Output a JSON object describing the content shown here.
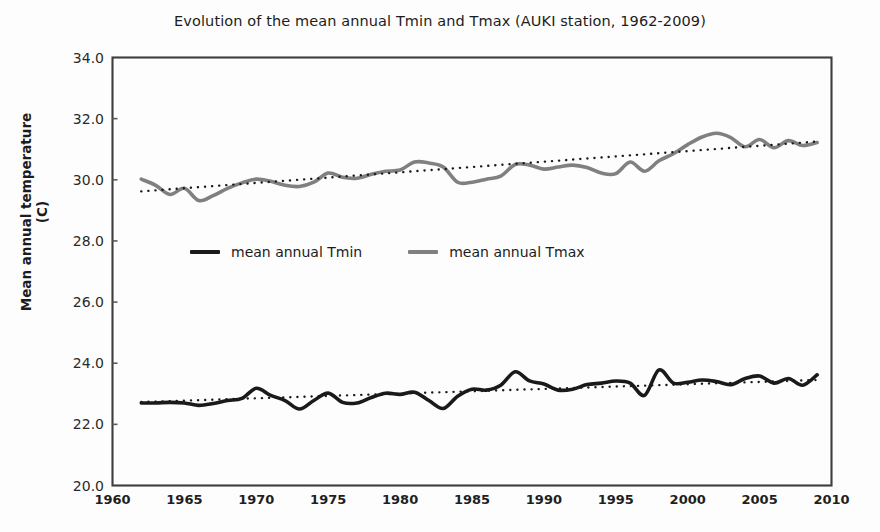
{
  "chart_data": {
    "type": "line",
    "title": "Evolution of the mean annual Tmin and Tmax (AUKI station, 1962-2009)",
    "xlabel": "",
    "ylabel": "Mean annual temperature (C)",
    "xlim": [
      1960,
      2010
    ],
    "ylim": [
      20.0,
      34.0
    ],
    "ytick_labels": [
      "34.0",
      "32.0",
      "30.0",
      "28.0",
      "26.0",
      "24.0",
      "22.0",
      "20.0"
    ],
    "ytick_values": [
      34.0,
      32.0,
      30.0,
      28.0,
      26.0,
      24.0,
      22.0,
      20.0
    ],
    "xtick_labels": [
      "1960",
      "1965",
      "1970",
      "1975",
      "1980",
      "1985",
      "1990",
      "1995",
      "2000",
      "2005",
      "2010"
    ],
    "xtick_values": [
      1960,
      1965,
      1970,
      1975,
      1980,
      1985,
      1990,
      1995,
      2000,
      2005,
      2010
    ],
    "grid": false,
    "legend_position": "inside-center-upper",
    "colors": {
      "tmin": "#1a1a1a",
      "tmax": "#808080",
      "trend": "#1a1a1a",
      "frame": "#3d3d3d",
      "background": "#fdfdfd"
    },
    "x": [
      1962,
      1963,
      1964,
      1965,
      1966,
      1967,
      1968,
      1969,
      1970,
      1971,
      1972,
      1973,
      1974,
      1975,
      1976,
      1977,
      1978,
      1979,
      1980,
      1981,
      1982,
      1983,
      1984,
      1985,
      1986,
      1987,
      1988,
      1989,
      1990,
      1991,
      1992,
      1993,
      1994,
      1995,
      1996,
      1997,
      1998,
      1999,
      2000,
      2001,
      2002,
      2003,
      2004,
      2005,
      2006,
      2007,
      2008,
      2009
    ],
    "series": [
      {
        "name": "mean annual Tmin",
        "color": "#1a1a1a",
        "values": [
          22.7,
          22.7,
          22.72,
          22.7,
          22.62,
          22.68,
          22.78,
          22.85,
          23.18,
          22.95,
          22.78,
          22.5,
          22.78,
          23.02,
          22.72,
          22.7,
          22.88,
          23.02,
          22.98,
          23.05,
          22.78,
          22.52,
          22.92,
          23.15,
          23.12,
          23.28,
          23.72,
          23.42,
          23.32,
          23.12,
          23.15,
          23.3,
          23.35,
          23.42,
          23.35,
          22.95,
          23.78,
          23.35,
          23.38,
          23.45,
          23.4,
          23.3,
          23.5,
          23.58,
          23.35,
          23.5,
          23.28,
          23.62
        ]
      },
      {
        "name": "mean annual Tmax",
        "color": "#808080",
        "values": [
          30.02,
          29.82,
          29.52,
          29.72,
          29.32,
          29.48,
          29.72,
          29.9,
          30.02,
          29.95,
          29.82,
          29.78,
          29.92,
          30.22,
          30.08,
          30.05,
          30.18,
          30.28,
          30.32,
          30.58,
          30.55,
          30.42,
          29.92,
          29.92,
          30.02,
          30.12,
          30.5,
          30.48,
          30.35,
          30.42,
          30.48,
          30.4,
          30.22,
          30.2,
          30.58,
          30.28,
          30.62,
          30.85,
          31.15,
          31.4,
          31.52,
          31.38,
          31.08,
          31.32,
          31.05,
          31.28,
          31.12,
          31.22
        ]
      }
    ],
    "trendlines": [
      {
        "name": "Tmin linear trend",
        "style": "dotted",
        "color": "#1a1a1a",
        "x_start": 1962,
        "x_end": 2009,
        "y_start": 22.73,
        "y_end": 23.45
      },
      {
        "name": "Tmax linear trend",
        "style": "dotted",
        "color": "#1a1a1a",
        "x_start": 1962,
        "x_end": 2009,
        "y_start": 29.62,
        "y_end": 31.25
      }
    ],
    "legend": [
      {
        "label": "mean annual Tmin",
        "color": "#1a1a1a"
      },
      {
        "label": "mean annual Tmax",
        "color": "#808080"
      }
    ]
  }
}
